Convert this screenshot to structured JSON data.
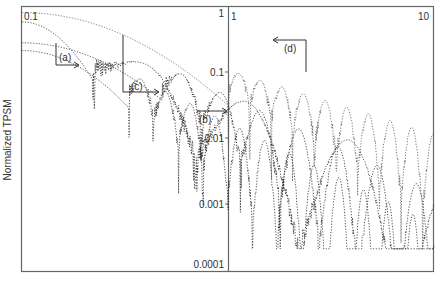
{
  "chart_data": {
    "type": "line",
    "title": "",
    "xlabel": "",
    "ylabel": "Normalized TPSM",
    "xscale": "log",
    "yscale": "log",
    "xlim": [
      0.1,
      10
    ],
    "ylim": [
      0.0001,
      1
    ],
    "grid": false,
    "legend": "none",
    "x_tick_labels": [
      "0.1",
      "1",
      "10"
    ],
    "y_tick_labels": [
      "1",
      "0.1",
      "0.01",
      "0.001",
      "0.0001"
    ],
    "y_ticks": [
      1,
      0.1,
      0.01,
      0.001,
      0.0001
    ],
    "divider_at_x": 1,
    "annotations": [
      {
        "label": "(a)",
        "arrow": "right",
        "x": 0.16,
        "y": 0.08
      },
      {
        "label": "(b)",
        "arrow": "right",
        "x": 0.75,
        "y": 0.025
      },
      {
        "label": "(c)",
        "arrow": "right",
        "x": 0.3,
        "y": 0.045
      },
      {
        "label": "(d)",
        "arrow": "left",
        "x": 1.9,
        "y": 0.25
      }
    ],
    "series": [
      {
        "name": "(a)",
        "description": "lowest-frequency oscillation, starts ~0.7 at x=0.1",
        "start_y": 0.7,
        "first_min_x": 0.22,
        "period_log": 0.5,
        "decay": 1.2
      },
      {
        "name": "(b)",
        "description": "high-frequency oscillation with deep minima",
        "start_y": 0.25,
        "first_min_x": 0.33,
        "period_log": 0.12,
        "decay": 1.6
      },
      {
        "name": "(c)",
        "description": "medium-frequency oscillation",
        "start_y": 0.33,
        "first_min_x": 0.48,
        "period_log": 0.19,
        "decay": 1.5
      },
      {
        "name": "(d)",
        "description": "smooth envelope peaks, first min near x=1",
        "start_y": 0.98,
        "first_min_x": 1.0,
        "period_log": 0.105,
        "decay": 1.0
      }
    ]
  },
  "labels": {
    "x_left": "0.1",
    "x_mid": "1",
    "x_right": "10",
    "y_1": "1",
    "y_01": "0.1",
    "y_001": "0.01",
    "y_0001": "0.001",
    "y_00001": "0.0001",
    "ylabel": "Normalized TPSM",
    "ann_a": "(a)",
    "ann_b": "(b)",
    "ann_c": "(c)",
    "ann_d": "(d)"
  },
  "colors": {
    "frame": "#666666",
    "curve": "#555555",
    "curve_dark": "#222222",
    "text": "#333333"
  }
}
